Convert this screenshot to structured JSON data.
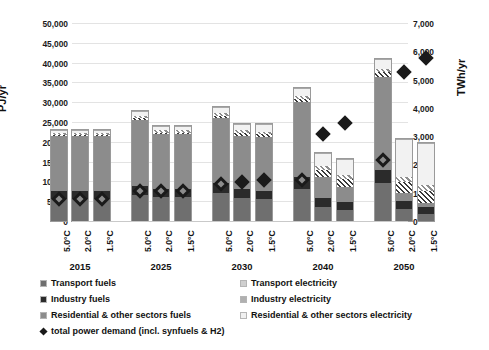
{
  "chart_data": {
    "type": "bar",
    "subtype": "stacked-bar-with-scatter-overlay",
    "title": "",
    "xlabel": "",
    "ylabel": "PJ/yr",
    "y2label": "TWh/yr",
    "ylim": [
      0,
      50000
    ],
    "y2lim": [
      0,
      7000
    ],
    "ytick_labels": [
      "0",
      "5,000",
      "10,000",
      "15,000",
      "20,000",
      "25,000",
      "30,000",
      "35,000",
      "40,000",
      "45,000",
      "50,000"
    ],
    "ytick_values": [
      0,
      5000,
      10000,
      15000,
      20000,
      25000,
      30000,
      35000,
      40000,
      45000,
      50000
    ],
    "y2tick_labels": [
      "0",
      "1,000",
      "2,000",
      "3,000",
      "4,000",
      "5,000",
      "6,000",
      "7,000"
    ],
    "y2tick_values": [
      0,
      1000,
      2000,
      3000,
      4000,
      5000,
      6000,
      7000
    ],
    "grid": true,
    "legend_position": "below",
    "year_groups": [
      "2015",
      "2025",
      "2030",
      "2040",
      "2050"
    ],
    "scenarios": [
      "5.0°C",
      "2.0°C",
      "1.5°C"
    ],
    "categories": [
      "2015 5.0°C",
      "2015 2.0°C",
      "2015 1.5°C",
      "2025 5.0°C",
      "2025 2.0°C",
      "2025 1.5°C",
      "2030 5.0°C",
      "2030 2.0°C",
      "2030 1.5°C",
      "2040 5.0°C",
      "2040 2.0°C",
      "2040 1.5°C",
      "2050 5.0°C",
      "2050 2.0°C",
      "2050 1.5°C"
    ],
    "series": [
      {
        "name": "Transport fuels",
        "key": "tf",
        "color": "#6f6f6f",
        "values": [
          5600,
          5600,
          5600,
          6500,
          6000,
          6000,
          7000,
          5800,
          5500,
          8000,
          3500,
          2800,
          9500,
          3000,
          1800
        ]
      },
      {
        "name": "Industry fuels",
        "key": "inf",
        "color": "#2b2b2b",
        "values": [
          2000,
          2000,
          2000,
          2300,
          2200,
          2200,
          2500,
          2200,
          2100,
          3000,
          2200,
          2000,
          3400,
          2100,
          1800
        ]
      },
      {
        "name": "Residential & other sectors fuels",
        "key": "rof",
        "color": "#8c8c8c",
        "values": [
          13800,
          13800,
          13800,
          16800,
          13700,
          13700,
          16500,
          13600,
          13600,
          19000,
          5500,
          3800,
          23500,
          1900,
          900
        ]
      },
      {
        "name": "Transport electricity",
        "key": "te",
        "color": "#cfcfcf",
        "values": [
          300,
          300,
          300,
          400,
          400,
          400,
          500,
          600,
          700,
          900,
          1700,
          2000,
          1200,
          2800,
          3100
        ]
      },
      {
        "name": "Industry electricity",
        "key": "ie",
        "color": "#b0b0b0",
        "values": [
          500,
          500,
          500,
          600,
          600,
          600,
          700,
          700,
          700,
          800,
          900,
          1000,
          900,
          1200,
          1400
        ]
      },
      {
        "name": "Residential & other sectors electricity",
        "key": "roe",
        "color": "#f0f0f0",
        "values": [
          800,
          800,
          800,
          1200,
          1100,
          1100,
          1500,
          1600,
          1800,
          2000,
          3500,
          4000,
          2300,
          9600,
          10600
        ]
      }
    ],
    "totals": [
      23000,
      23000,
      23000,
      27800,
      24000,
      24000,
      28700,
      24500,
      24400,
      33700,
      17300,
      15600,
      40800,
      20600,
      19600
    ],
    "overlay": {
      "name": "total power demand (incl. synfuels & H2)",
      "marker": "diamond",
      "axis": "right",
      "unit": "TWh/yr",
      "values": [
        800,
        800,
        800,
        1100,
        1100,
        1100,
        1350,
        1350,
        1400,
        1500,
        1800,
        2100,
        2200,
        3200,
        3500
      ],
      "filled_values": [
        null,
        null,
        null,
        null,
        null,
        null,
        null,
        1400,
        1500,
        null,
        3100,
        3500,
        null,
        5300,
        5800
      ]
    }
  },
  "axes": {
    "left_title": "PJ/yr",
    "right_title": "TWh/yr"
  },
  "legend": {
    "items": [
      {
        "label": "Transport fuels",
        "key": "tf"
      },
      {
        "label": "Transport electricity",
        "key": "te"
      },
      {
        "label": "Industry fuels",
        "key": "inf"
      },
      {
        "label": "Industry electricity",
        "key": "ie"
      },
      {
        "label": "Residential & other sectors fuels",
        "key": "rof"
      },
      {
        "label": "Residential & other sectors electricity",
        "key": "roe"
      },
      {
        "label": "total power demand (incl. synfuels & H2)",
        "key": "marker"
      }
    ]
  },
  "colors": {
    "transport_fuels": "#6f6f6f",
    "industry_fuels": "#2b2b2b",
    "residential_fuels": "#8c8c8c",
    "transport_electricity": "#cfcfcf",
    "industry_electricity": "#b0b0b0",
    "residential_electricity": "#f0f0f0",
    "marker": "#1a1a1a",
    "gridline": "#e3e3e3"
  }
}
